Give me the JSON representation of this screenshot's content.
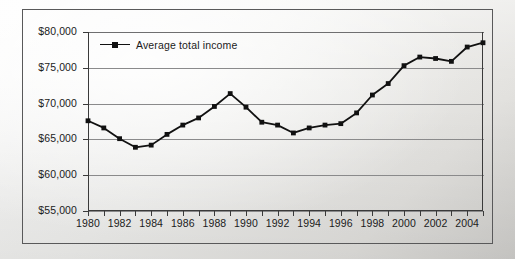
{
  "chart_data": {
    "type": "line",
    "title": "",
    "subtitle": "",
    "xlabel": "",
    "ylabel": "",
    "grid": true,
    "legend_position": "top-left",
    "xlim": [
      1980,
      2005
    ],
    "ylim": [
      55000,
      80000
    ],
    "y_ticks": [
      55000,
      60000,
      65000,
      70000,
      75000,
      80000
    ],
    "y_tick_labels": [
      "$55,000",
      "$60,000",
      "$65,000",
      "$70,000",
      "$75,000",
      "$80,000"
    ],
    "x_ticks": [
      1980,
      1981,
      1982,
      1983,
      1984,
      1985,
      1986,
      1987,
      1988,
      1989,
      1990,
      1991,
      1992,
      1993,
      1994,
      1995,
      1996,
      1997,
      1998,
      1999,
      2000,
      2001,
      2002,
      2003,
      2004,
      2005
    ],
    "x_tick_labels": [
      "1980",
      "",
      "1982",
      "",
      "1984",
      "",
      "1986",
      "",
      "1988",
      "",
      "1990",
      "",
      "1992",
      "",
      "1994",
      "",
      "1996",
      "",
      "1998",
      "",
      "2000",
      "",
      "2002",
      "",
      "2004",
      ""
    ],
    "x_labeled_ticks": [
      "1980",
      "1982",
      "1984",
      "1986",
      "1988",
      "1990",
      "1992",
      "1994",
      "1996",
      "1998",
      "2000",
      "2002",
      "2004"
    ],
    "series": [
      {
        "name": "Average total income",
        "color": "#111111",
        "marker": "square",
        "x": [
          1980,
          1981,
          1982,
          1983,
          1984,
          1985,
          1986,
          1987,
          1988,
          1989,
          1990,
          1991,
          1992,
          1993,
          1994,
          1995,
          1996,
          1997,
          1998,
          1999,
          2000,
          2001,
          2002,
          2003,
          2004,
          2005
        ],
        "values": [
          67600,
          66600,
          65100,
          63900,
          64200,
          65700,
          67000,
          68000,
          69600,
          71400,
          69500,
          67400,
          67000,
          65900,
          66600,
          67000,
          67200,
          68700,
          71200,
          72800,
          75300,
          76500,
          76300,
          75900,
          77900,
          78500
        ]
      }
    ]
  },
  "legend": {
    "entries": [
      {
        "label": "Average total income"
      }
    ]
  },
  "axes": {
    "y_labels": [
      "$80,000",
      "$75,000",
      "$70,000",
      "$65,000",
      "$60,000",
      "$55,000"
    ],
    "x_labels": [
      "1980",
      "1982",
      "1984",
      "1986",
      "1988",
      "1990",
      "1992",
      "1994",
      "1996",
      "1998",
      "2000",
      "2002",
      "2004"
    ]
  },
  "colors": {
    "series": "#111111",
    "axis": "#3a3a3a",
    "grid": "#8a8a8b",
    "frame": "#59595a",
    "text": "#1b1b1b"
  }
}
